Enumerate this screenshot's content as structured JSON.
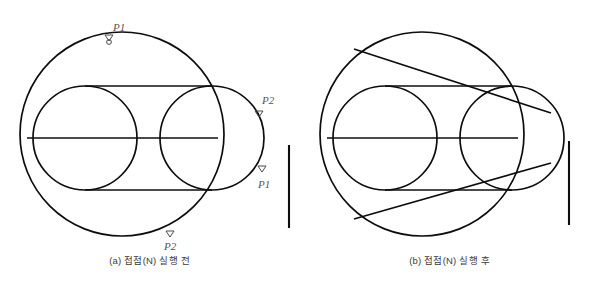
{
  "document": {
    "title": "접점(N) 스냅 실행 전후 비교 도면",
    "background_color": "#ffffff",
    "line_color": "#0d0d0d",
    "label_color": "#565656",
    "caption_color": "#3b3b3b"
  },
  "panels": [
    {
      "id": "panel-a",
      "caption": "(a) 접점(N) 실행 전",
      "point_labels": [
        {
          "name": "p1-top",
          "text": "P1",
          "x": 120,
          "y": 27,
          "marker_x": 109,
          "marker_y": 38
        },
        {
          "name": "p2-right",
          "text": "P2",
          "x": 263,
          "y": 102,
          "marker_x": 259,
          "marker_y": 114
        },
        {
          "name": "p1-lower-right",
          "text": "P1",
          "x": 259,
          "y": 186,
          "marker_x": 262,
          "marker_y": 169
        },
        {
          "name": "p2-bottom",
          "text": "P2",
          "x": 167,
          "y": 248,
          "marker_x": 170,
          "marker_y": 234
        }
      ]
    },
    {
      "id": "panel-b",
      "caption": "(b) 접점(N) 실행 후",
      "point_labels": []
    }
  ],
  "geometry": {
    "panel_a": {
      "major_circle": {
        "cx": 122,
        "cy": 134,
        "r": 102
      },
      "left_circle": {
        "cx": 85,
        "cy": 138,
        "r": 52
      },
      "right_circle": {
        "cx": 212,
        "cy": 138,
        "r": 52
      },
      "top_tangent": {
        "x1": 85,
        "y1": 86,
        "x2": 212,
        "y2": 86
      },
      "bottom_tangent": {
        "x1": 85,
        "y1": 190,
        "x2": 212,
        "y2": 190
      },
      "center_axis": {
        "x1": 27,
        "y1": 138,
        "x2": 218,
        "y2": 138
      },
      "reference_bar": {
        "x": 289,
        "y1": 145,
        "y2": 228
      }
    },
    "panel_b": {
      "major_circle": {
        "cx": 122,
        "cy": 134,
        "r": 102
      },
      "left_circle": {
        "cx": 85,
        "cy": 138,
        "r": 52
      },
      "right_circle": {
        "cx": 212,
        "cy": 138,
        "r": 52
      },
      "top_tangent": {
        "x1": 85,
        "y1": 86,
        "x2": 212,
        "y2": 86
      },
      "bottom_tangent": {
        "x1": 85,
        "y1": 190,
        "x2": 212,
        "y2": 190
      },
      "center_axis": {
        "x1": 27,
        "y1": 138,
        "x2": 218,
        "y2": 138
      },
      "outer_tangent_upper": {
        "x1": 54,
        "y1": 49,
        "x2": 251,
        "y2": 113
      },
      "outer_tangent_lower": {
        "x1": 54,
        "y1": 219,
        "x2": 251,
        "y2": 163
      },
      "reference_bar": {
        "x": 269,
        "y1": 141,
        "y2": 225
      }
    }
  }
}
